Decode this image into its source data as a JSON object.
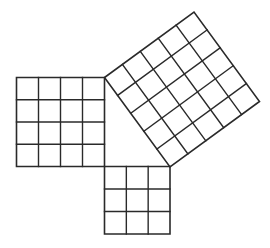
{
  "diagram": {
    "type": "pythagorean-theorem-squares",
    "background": "#ffffff",
    "line_color": "#2a2a2a",
    "triangle": {
      "legs": [
        3,
        4
      ],
      "hypotenuse": 5,
      "vertices": {
        "top": [
          104.5,
          77.5
        ],
        "right_angle": [
          104.5,
          166.5
        ],
        "bottom_right": [
          170,
          166.5
        ]
      }
    },
    "squares": [
      {
        "id": "leg-a-square",
        "side_units": 4,
        "grid": "4x4",
        "cell_count": 16,
        "origin": [
          104.5,
          77.5
        ],
        "u": [
          -88,
          0
        ],
        "v": [
          0,
          89
        ]
      },
      {
        "id": "leg-b-square",
        "side_units": 3,
        "grid": "3x3",
        "cell_count": 9,
        "origin": [
          104.5,
          166.5
        ],
        "u": [
          65.5,
          0
        ],
        "v": [
          0,
          67.5
        ]
      },
      {
        "id": "hypotenuse-square",
        "side_units": 5,
        "grid": "5x5",
        "cell_count": 25,
        "origin": [
          104.5,
          77.5
        ],
        "u": [
          65.5,
          89.5
        ],
        "v": [
          89.5,
          -65.5
        ]
      }
    ]
  }
}
